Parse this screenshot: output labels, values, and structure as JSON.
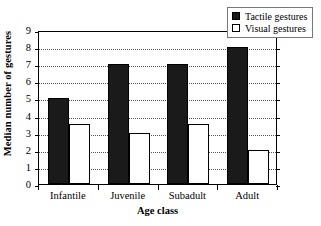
{
  "chart_data": {
    "type": "bar",
    "title": "",
    "xlabel": "Age class",
    "ylabel": "Median number of gestures",
    "categories": [
      "Infantile",
      "Juvenile",
      "Subadult",
      "Adult"
    ],
    "series": [
      {
        "name": "Tactile gestures",
        "values": [
          5,
          7,
          7,
          8
        ],
        "color": "#1a1a1a",
        "swatch": "filled"
      },
      {
        "name": "Visual gestures",
        "values": [
          3.5,
          3,
          3.5,
          2
        ],
        "color": "#ffffff",
        "swatch": "open"
      }
    ],
    "ylim": [
      0,
      9
    ],
    "yticks": [
      0,
      1,
      2,
      3,
      4,
      5,
      6,
      7,
      8,
      9
    ],
    "ytick_labels": [
      "0",
      "1",
      "2",
      "3",
      "4",
      "5",
      "6",
      "7",
      "8",
      "9"
    ],
    "grid": true,
    "grid_style": "dotted-horizontal",
    "legend_position": "top-right",
    "legend_entries": [
      "Tactile gestures",
      "Visual gestures"
    ]
  },
  "legend": {
    "items": [
      {
        "label": "Tactile gestures"
      },
      {
        "label": "Visual gestures"
      }
    ]
  },
  "axes": {
    "y_title": "Median number of gestures",
    "x_title": "Age class"
  }
}
